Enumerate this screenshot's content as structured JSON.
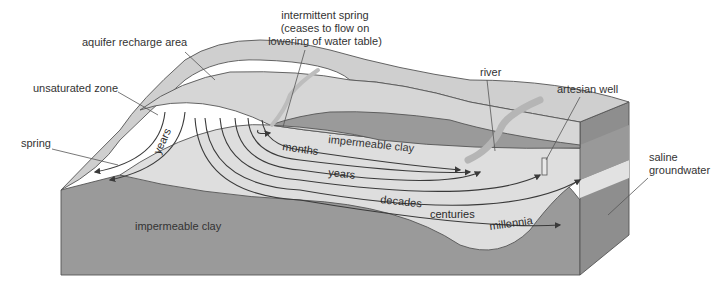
{
  "diagram": {
    "type": "groundwater-flow-cross-section",
    "colors": {
      "background": "#ffffff",
      "surface": "#cfcfcf",
      "aquifer": "#dedede",
      "clay": "#9a9a9a",
      "clay_dark": "#8e8e8e",
      "saline": "#e2e2e2",
      "text": "#333333",
      "flow_line": "#3a3a3a"
    },
    "labels": {
      "intermittent_spring_line1": "intermittent spring",
      "intermittent_spring_line2": "(ceases to flow on",
      "intermittent_spring_line3": "lowering of water table)",
      "aquifer_recharge_area": "aquifer recharge area",
      "unsaturated_zone": "unsaturated zone",
      "spring": "spring",
      "river": "river",
      "artesian_well": "artesian well",
      "saline_line1": "saline",
      "saline_line2": "groundwater",
      "impermeable_clay_upper": "impermeable clay",
      "impermeable_clay_lower": "impermeable clay"
    },
    "flow_times": {
      "years_left": "years",
      "months": "months",
      "years": "years",
      "decades": "decades",
      "centuries": "centuries",
      "millennia": "millennia"
    }
  }
}
